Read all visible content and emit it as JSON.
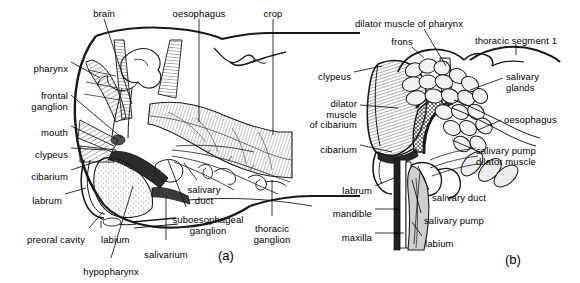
{
  "figure": {
    "type": "anatomical-diagram",
    "panels": [
      {
        "tag": "(a)",
        "name": "lateral-section-of-head",
        "labels": [
          {
            "key": "brain",
            "text": "brain",
            "align": "center",
            "x": 104,
            "y": 9
          },
          {
            "key": "oesophagus_a",
            "text": "oesophagus",
            "align": "center",
            "x": 199,
            "y": 9
          },
          {
            "key": "crop",
            "text": "crop",
            "align": "center",
            "x": 273,
            "y": 9
          },
          {
            "key": "pharynx",
            "text": "pharynx",
            "align": "right",
            "x": 68,
            "y": 64
          },
          {
            "key": "frontal_ganglion",
            "text": "frontal\nganglion",
            "align": "right",
            "x": 68,
            "y": 91
          },
          {
            "key": "mouth",
            "text": "mouth",
            "align": "right",
            "x": 68,
            "y": 128
          },
          {
            "key": "clypeus",
            "text": "clypeus",
            "align": "right",
            "x": 68,
            "y": 150
          },
          {
            "key": "cibarium",
            "text": "cibarium",
            "align": "right",
            "x": 68,
            "y": 172
          },
          {
            "key": "labrum",
            "text": "labrum",
            "align": "right",
            "x": 62,
            "y": 196
          },
          {
            "key": "preoral_cavity",
            "text": "preoral cavity",
            "align": "right",
            "x": 85,
            "y": 235
          },
          {
            "key": "labium",
            "text": "labium",
            "align": "left",
            "x": 101,
            "y": 235
          },
          {
            "key": "hypopharynx",
            "text": "hypopharynx",
            "align": "center",
            "x": 111,
            "y": 267
          },
          {
            "key": "salivarium",
            "text": "salivarium",
            "align": "center",
            "x": 166,
            "y": 250
          },
          {
            "key": "salivary_duct",
            "text": "salivary\nduct",
            "align": "center",
            "x": 204,
            "y": 185
          },
          {
            "key": "suboesophageal_ganglion",
            "text": "suboesophageal\nganglion",
            "align": "center",
            "x": 208,
            "y": 215
          },
          {
            "key": "thoracic_ganglion",
            "text": "thoracic\nganglion",
            "align": "center",
            "x": 272,
            "y": 224
          }
        ]
      },
      {
        "tag": "(b)",
        "name": "detail-of-cibarial-and-salivary-pumps",
        "labels": [
          {
            "key": "dilator_muscle_of_pharynx",
            "text": "dilator muscle of pharynx",
            "align": "center",
            "x": 409,
            "y": 19
          },
          {
            "key": "frons",
            "text": "frons",
            "align": "center",
            "x": 402,
            "y": 37
          },
          {
            "key": "thoracic_segment_1",
            "text": "thoracic segment 1",
            "align": "center",
            "x": 516,
            "y": 36
          },
          {
            "key": "clypeus_b",
            "text": "clypeus",
            "align": "right",
            "x": 351,
            "y": 72
          },
          {
            "key": "dilator_muscle_of_cibarium",
            "text": "dilator\nmuscle\nof cibarium",
            "align": "right",
            "x": 357,
            "y": 99
          },
          {
            "key": "cibarium_b",
            "text": "cibarium",
            "align": "right",
            "x": 357,
            "y": 145
          },
          {
            "key": "salivary_glands",
            "text": "salivary\nglands",
            "align": "left",
            "x": 506,
            "y": 72
          },
          {
            "key": "oesophagus_b",
            "text": "oesophagus",
            "align": "left",
            "x": 504,
            "y": 115
          },
          {
            "key": "salivary_pump_dilator_muscle",
            "text": "salivary pump\ndilator muscle",
            "align": "left",
            "x": 476,
            "y": 146
          },
          {
            "key": "labrum_b",
            "text": "labrum",
            "align": "right",
            "x": 372,
            "y": 186
          },
          {
            "key": "mandible",
            "text": "mandible",
            "align": "right",
            "x": 372,
            "y": 209
          },
          {
            "key": "maxilla",
            "text": "maxilla",
            "align": "right",
            "x": 372,
            "y": 233
          },
          {
            "key": "salivary_duct_b",
            "text": "salivary duct",
            "align": "left",
            "x": 432,
            "y": 193
          },
          {
            "key": "salivary_pump",
            "text": "salivary pump",
            "align": "left",
            "x": 424,
            "y": 216
          },
          {
            "key": "labium_b",
            "text": "labium",
            "align": "left",
            "x": 425,
            "y": 239
          }
        ]
      }
    ],
    "colors": {
      "ink": "#1a1a1a",
      "background": "#ffffff",
      "tissue_light": "#d8d8d8",
      "tissue_mid": "#b0b0b0",
      "tissue_dark": "#5a5a5a",
      "hatch": "#606060"
    }
  }
}
